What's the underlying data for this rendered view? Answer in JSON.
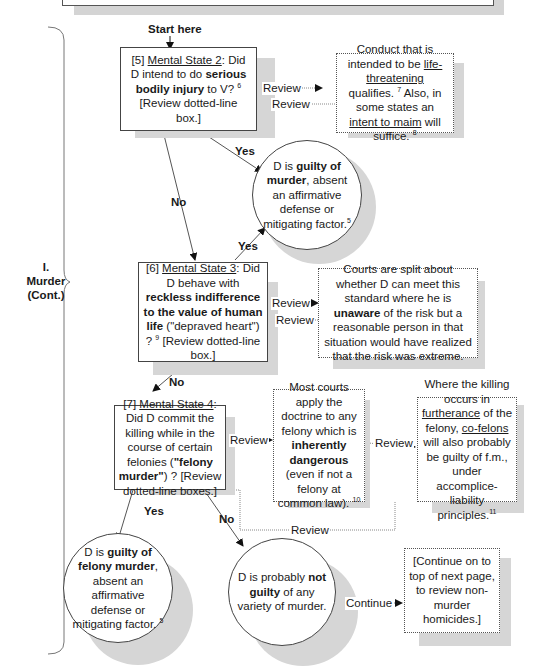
{
  "side_label": {
    "line1": "I.",
    "line2": "Murder",
    "line3": "(Cont.)"
  },
  "start_label": "Start here",
  "nodes": {
    "ms2": {
      "num": "[5]",
      "title": "Mental State 2",
      "t1": ": Did D intend to do ",
      "b1": "serious bodily injury",
      "t2": " to V? ",
      "fn": "6",
      "t3": " [Review dotted-line box.]"
    },
    "ms2_note": {
      "t1": "Conduct that is intended to be ",
      "u1": "life-threatening",
      "t2": " qualifies. ",
      "fn1": "7",
      "t3": " Also, in some states an ",
      "u2": "intent to maim",
      "t4": " will suffice. ",
      "fn2": "8"
    },
    "guilty_murder": {
      "t1": "D is ",
      "b1": "guilty of murder",
      "t2": ", absent an affirmative defense or mitigating factor.",
      "fn": "5"
    },
    "ms3": {
      "num": "[6]",
      "title": "Mental State 3",
      "t1": ": Did D behave with ",
      "b1": "reckless indifference to the value of human life",
      "t2": " (\"depraved heart\") ? ",
      "fn": "9",
      "t3": " [Review dotted-line box.]"
    },
    "ms3_note": {
      "t1": "Courts are split about whether D can meet this standard where he is ",
      "b1": "unaware",
      "t2": " of the risk but a reasonable person in that situation would have realized that the risk was extreme."
    },
    "ms4": {
      "num": "[7]",
      "title": "Mental State 4",
      "t1": ": Did D commit the killing while in the course of certain felonies  (",
      "b1": "\"felony murder\"",
      "t2": ") ? [Review dotted-line boxes.]"
    },
    "ms4_note1": {
      "t1": "Most courts apply the doctrine to any felony which is ",
      "b1": "inherently dangerous",
      "t2": " (even if not a felony at common law). ",
      "fn": "10"
    },
    "ms4_note2": {
      "t1": "Where the killing occurs in ",
      "u1": "furtherance",
      "t2": " of the felony, ",
      "u2": "co-felons",
      "t3": " will also probably be guilty of f.m., under accomplice-liability principles.",
      "fn": "11"
    },
    "guilty_felony": {
      "t1": "D is ",
      "b1": "guilty of felony murder",
      "t2": ", absent an affirmative defense or mitigating factor. ",
      "fn": "5"
    },
    "not_guilty": {
      "t1": "D is probably ",
      "b1": "not guilty",
      "t2": " of any variety of murder."
    },
    "continue_box": {
      "text": "[Continue on to top of next page, to review non-murder homicides.]"
    }
  },
  "edges": {
    "review": "Review",
    "yes": "Yes",
    "no": "No",
    "continue": "Continue"
  }
}
